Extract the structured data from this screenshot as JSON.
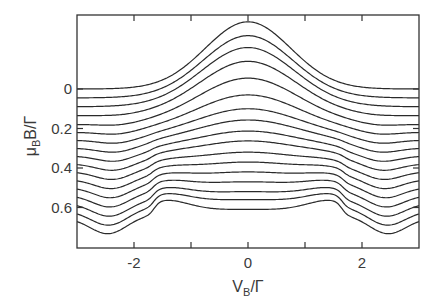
{
  "chart_data": {
    "type": "line",
    "title": "",
    "xlabel": "V_B/Γ",
    "ylabel": "μ_B B/Γ",
    "xlim": [
      -3,
      3
    ],
    "ylim_note": "y axis shows field offset; curves are vertically offset traces",
    "x_ticks": [
      -2,
      0,
      2
    ],
    "x_minor_ticks": [
      -1,
      1
    ],
    "y_ticks": [
      0,
      0.2,
      0.4,
      0.6
    ],
    "y_tick_labels": [
      "0",
      "0.2",
      "0.4",
      "0.6"
    ],
    "grid": false,
    "legend": null,
    "n_curves": 17,
    "field_step": 0.04,
    "series_description": "Offset curves at μ_B B/Γ = 0, 0.04, ..., 0.64. Top curve shows a central peak at V_B=0; with increasing field the peak flattens into a dip, with shoulders/steps appearing near |V_B| ≈ 1.7 and a broad minimum near |V_B| ≈ 2.4 for the highest fields.",
    "series": [
      {
        "name": "B=0.00",
        "baseline": 0.0,
        "center": -0.34,
        "edge_dip": 0.0
      },
      {
        "name": "B=0.04",
        "baseline": 0.045,
        "center": -0.27,
        "edge_dip": 0.0
      },
      {
        "name": "B=0.08",
        "baseline": 0.09,
        "center": -0.21,
        "edge_dip": 0.005
      },
      {
        "name": "B=0.12",
        "baseline": 0.135,
        "center": -0.14,
        "edge_dip": 0.01
      },
      {
        "name": "B=0.16",
        "baseline": 0.18,
        "center": -0.055,
        "edge_dip": 0.015
      },
      {
        "name": "B=0.20",
        "baseline": 0.22,
        "center": 0.03,
        "edge_dip": 0.02
      },
      {
        "name": "B=0.24",
        "baseline": 0.26,
        "center": 0.1,
        "edge_dip": 0.025
      },
      {
        "name": "B=0.28",
        "baseline": 0.3,
        "center": 0.157,
        "edge_dip": 0.03
      },
      {
        "name": "B=0.32",
        "baseline": 0.34,
        "center": 0.213,
        "edge_dip": 0.035
      },
      {
        "name": "B=0.36",
        "baseline": 0.38,
        "center": 0.263,
        "edge_dip": 0.04
      },
      {
        "name": "B=0.40",
        "baseline": 0.42,
        "center": 0.32,
        "edge_dip": 0.045
      },
      {
        "name": "B=0.44",
        "baseline": 0.46,
        "center": 0.37,
        "edge_dip": 0.05
      },
      {
        "name": "B=0.48",
        "baseline": 0.5,
        "center": 0.42,
        "edge_dip": 0.055
      },
      {
        "name": "B=0.52",
        "baseline": 0.54,
        "center": 0.47,
        "edge_dip": 0.06
      },
      {
        "name": "B=0.56",
        "baseline": 0.58,
        "center": 0.52,
        "edge_dip": 0.065
      },
      {
        "name": "B=0.60",
        "baseline": 0.62,
        "center": 0.56,
        "edge_dip": 0.07
      },
      {
        "name": "B=0.64",
        "baseline": 0.655,
        "center": 0.61,
        "edge_dip": 0.075
      }
    ]
  },
  "colors": {
    "line": "#2a2a2a",
    "axis": "#333333",
    "background": "#ffffff"
  }
}
